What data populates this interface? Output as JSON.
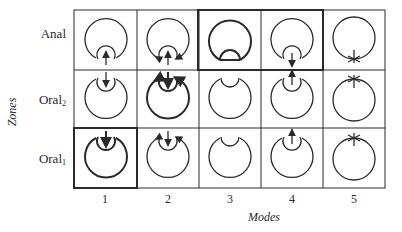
{
  "diagram": {
    "y_axis_label": "Zones",
    "x_axis_label": "Modes",
    "rows": [
      {
        "name": "Anal",
        "sub": ""
      },
      {
        "name": "Oral",
        "sub": "2"
      },
      {
        "name": "Oral",
        "sub": "1"
      }
    ],
    "columns": [
      "1",
      "2",
      "3",
      "4",
      "5"
    ],
    "highlighted_boxes": [
      {
        "row": "Anal",
        "modes": [
          "3",
          "4"
        ]
      },
      {
        "row": "Oral1",
        "modes": [
          "1"
        ]
      }
    ],
    "cells": [
      {
        "row": "Anal",
        "mode": "1",
        "glyph": "inner-circle-bottom",
        "arrows": "center-up",
        "bold": false
      },
      {
        "row": "Anal",
        "mode": "2",
        "glyph": "inner-circle-bottom",
        "arrows": "center-up + outer-in",
        "bold": false
      },
      {
        "row": "Anal",
        "mode": "3",
        "glyph": "inner-circle-bottom-closed",
        "arrows": "none",
        "bold": true
      },
      {
        "row": "Anal",
        "mode": "4",
        "glyph": "inner-circle-bottom",
        "arrows": "center-down",
        "bold": false
      },
      {
        "row": "Anal",
        "mode": "5",
        "glyph": "circle-cross-bottom",
        "arrows": "none",
        "bold": false
      },
      {
        "row": "Oral2",
        "mode": "1",
        "glyph": "inner-circle-top",
        "arrows": "center-down",
        "bold": false
      },
      {
        "row": "Oral2",
        "mode": "2",
        "glyph": "inner-circle-top",
        "arrows": "center-down + outer-in",
        "bold": true
      },
      {
        "row": "Oral2",
        "mode": "3",
        "glyph": "inner-circle-top-closed",
        "arrows": "none",
        "bold": false
      },
      {
        "row": "Oral2",
        "mode": "4",
        "glyph": "inner-circle-top",
        "arrows": "center-up",
        "bold": false
      },
      {
        "row": "Oral2",
        "mode": "5",
        "glyph": "circle-cross-top",
        "arrows": "none",
        "bold": false
      },
      {
        "row": "Oral1",
        "mode": "1",
        "glyph": "inner-circle-top",
        "arrows": "center-down",
        "bold": true
      },
      {
        "row": "Oral1",
        "mode": "2",
        "glyph": "inner-circle-top",
        "arrows": "center-down + outer-in",
        "bold": false
      },
      {
        "row": "Oral1",
        "mode": "3",
        "glyph": "inner-circle-top-closed",
        "arrows": "none",
        "bold": false
      },
      {
        "row": "Oral1",
        "mode": "4",
        "glyph": "inner-circle-top",
        "arrows": "center-up",
        "bold": false
      },
      {
        "row": "Oral1",
        "mode": "5",
        "glyph": "circle-cross-top",
        "arrows": "none",
        "bold": false
      }
    ],
    "colors": {
      "ink": "#2a2a2a",
      "background": "#ffffff"
    }
  }
}
